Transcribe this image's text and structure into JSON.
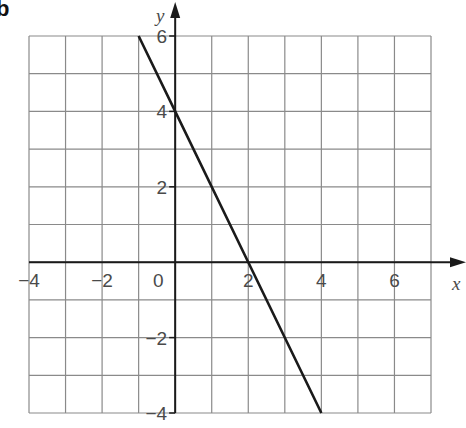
{
  "panel_label": "b",
  "chart_data": {
    "type": "line",
    "title": "",
    "xlabel": "x",
    "ylabel": "y",
    "xlim": [
      -4,
      7
    ],
    "ylim": [
      -4,
      6
    ],
    "grid": true,
    "x_ticks": [
      -4,
      -2,
      0,
      2,
      4,
      6
    ],
    "y_ticks": [
      -4,
      -2,
      2,
      4,
      6
    ],
    "x_tick_labels": [
      "−4",
      "−2",
      "0",
      "2",
      "4",
      "6"
    ],
    "y_tick_labels": [
      "−4",
      "−2",
      "2",
      "4",
      "6"
    ],
    "series": [
      {
        "name": "y = -2x + 4",
        "x": [
          -1,
          0,
          2,
          4
        ],
        "y": [
          6,
          4,
          0,
          -4
        ],
        "color": "#1a1a1a"
      }
    ],
    "annotations": [
      "y-intercept at (0, 4)",
      "x-intercept at (2, 0)"
    ]
  }
}
